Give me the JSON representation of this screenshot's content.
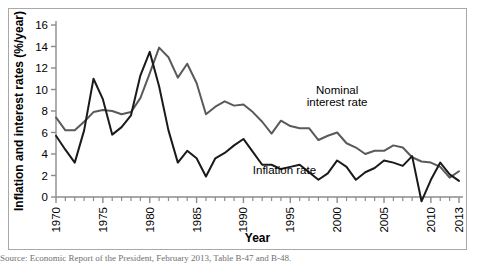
{
  "figure": {
    "y_axis_title": "Inflation and interest rates (%/year)",
    "x_axis_title": "Year",
    "series_labels": {
      "nominal": "Nominal\ninterest rate",
      "nominal_line1": "Nominal",
      "nominal_line2": "interest rate",
      "inflation": "Inflation rate"
    },
    "colors": {
      "nominal_line": "#5a5a5a",
      "inflation_line": "#1a1a1a",
      "axis": "#8c8c8c",
      "frame": "#a8a8a8",
      "background": "#ffffff",
      "text": "#000000"
    },
    "caption": "Source: Economic Report of the President, February 2013, Table B-47 and B-48."
  },
  "chart_data": {
    "type": "line",
    "title": "",
    "xlabel": "Year",
    "ylabel": "Inflation and interest rates (%/year)",
    "xlim": [
      1970,
      2013
    ],
    "ylim": [
      -2,
      16
    ],
    "grid": false,
    "legend": "inline-annotations",
    "xticks": [
      1970,
      1975,
      1980,
      1985,
      1990,
      1995,
      2000,
      2005,
      2010,
      2013
    ],
    "xtick_labels": [
      "1970",
      "1975",
      "1980",
      "1985",
      "1990",
      "1995",
      "2000",
      "2005",
      "2010",
      "2013"
    ],
    "xticks_minor": [
      1971,
      1972,
      1973,
      1974,
      1976,
      1977,
      1978,
      1979,
      1981,
      1982,
      1983,
      1984,
      1986,
      1987,
      1988,
      1989,
      1991,
      1992,
      1993,
      1994,
      1996,
      1997,
      1998,
      1999,
      2001,
      2002,
      2003,
      2004,
      2006,
      2007,
      2008,
      2009,
      2011,
      2012
    ],
    "yticks": [
      0,
      2,
      4,
      6,
      8,
      10,
      12,
      14,
      16
    ],
    "ytick_labels": [
      "0",
      "2",
      "4",
      "6",
      "8",
      "10",
      "12",
      "14",
      "16"
    ],
    "x": [
      1970,
      1971,
      1972,
      1973,
      1974,
      1975,
      1976,
      1977,
      1978,
      1979,
      1980,
      1981,
      1982,
      1983,
      1984,
      1985,
      1986,
      1987,
      1988,
      1989,
      1990,
      1991,
      1992,
      1993,
      1994,
      1995,
      1996,
      1997,
      1998,
      1999,
      2000,
      2001,
      2002,
      2003,
      2004,
      2005,
      2006,
      2007,
      2008,
      2009,
      2010,
      2011,
      2012,
      2013
    ],
    "series": [
      {
        "name": "Nominal interest rate",
        "color": "#5a5a5a",
        "label_position": {
          "x": 2000,
          "y": 9.6
        },
        "values": [
          7.4,
          6.2,
          6.2,
          7.0,
          7.9,
          8.1,
          8.0,
          7.7,
          7.9,
          9.2,
          11.5,
          13.9,
          13.0,
          11.1,
          12.4,
          10.6,
          7.7,
          8.4,
          8.9,
          8.5,
          8.6,
          7.9,
          7.0,
          5.9,
          7.1,
          6.6,
          6.4,
          6.4,
          5.3,
          5.7,
          6.0,
          5.0,
          4.6,
          4.0,
          4.3,
          4.3,
          4.8,
          4.6,
          3.7,
          3.3,
          3.2,
          2.8,
          1.8,
          2.4
        ]
      },
      {
        "name": "Inflation rate",
        "color": "#1a1a1a",
        "label_position": {
          "x": 1991,
          "y": 2.1
        },
        "values": [
          5.7,
          4.4,
          3.2,
          6.2,
          11.0,
          9.1,
          5.8,
          6.5,
          7.6,
          11.3,
          13.5,
          10.3,
          6.2,
          3.2,
          4.3,
          3.6,
          1.9,
          3.6,
          4.1,
          4.8,
          5.4,
          4.2,
          3.0,
          3.0,
          2.6,
          2.8,
          3.0,
          2.3,
          1.6,
          2.2,
          3.4,
          2.8,
          1.6,
          2.3,
          2.7,
          3.4,
          3.2,
          2.9,
          3.8,
          -0.4,
          1.6,
          3.2,
          2.1,
          1.5
        ]
      }
    ]
  }
}
